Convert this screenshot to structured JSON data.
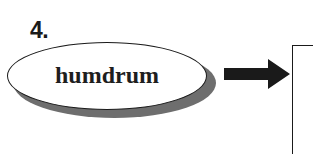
{
  "item": {
    "number": "4.",
    "word": "humdrum"
  },
  "icons": {
    "arrow": "right-arrow-icon"
  },
  "colors": {
    "ink": "#1a1a1a",
    "shadow": "#6e6e6e",
    "background": "#ffffff"
  }
}
